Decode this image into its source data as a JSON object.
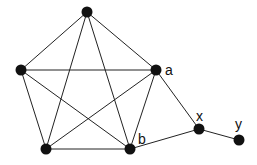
{
  "diagram": {
    "type": "graph",
    "nodes": [
      {
        "id": "top",
        "label": "",
        "x": 87,
        "y": 12
      },
      {
        "id": "left",
        "label": "",
        "x": 21,
        "y": 70
      },
      {
        "id": "a",
        "label": "a",
        "x": 156,
        "y": 70
      },
      {
        "id": "bottom-left",
        "label": "",
        "x": 46,
        "y": 149
      },
      {
        "id": "b",
        "label": "b",
        "x": 130,
        "y": 149
      },
      {
        "id": "x",
        "label": "x",
        "x": 199,
        "y": 129
      },
      {
        "id": "y",
        "label": "y",
        "x": 239,
        "y": 140
      }
    ],
    "edges": [
      [
        "top",
        "left"
      ],
      [
        "top",
        "a"
      ],
      [
        "top",
        "bottom-left"
      ],
      [
        "top",
        "b"
      ],
      [
        "left",
        "a"
      ],
      [
        "left",
        "bottom-left"
      ],
      [
        "left",
        "b"
      ],
      [
        "a",
        "bottom-left"
      ],
      [
        "a",
        "b"
      ],
      [
        "bottom-left",
        "b"
      ],
      [
        "a",
        "x"
      ],
      [
        "b",
        "x"
      ],
      [
        "x",
        "y"
      ]
    ],
    "labels": {
      "a": "a",
      "b": "b",
      "x": "x",
      "y": "y"
    },
    "colors": {
      "node": "#111111",
      "edge": "#222222",
      "background": "#ffffff"
    }
  }
}
